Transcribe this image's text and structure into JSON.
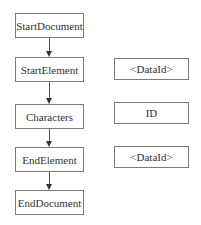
{
  "diagram": {
    "flow": [
      {
        "label": "StartDocument"
      },
      {
        "label": "StartElement"
      },
      {
        "label": "Characters"
      },
      {
        "label": "EndElement"
      },
      {
        "label": "EndDocument"
      }
    ],
    "values": [
      {
        "label": "<DataId>"
      },
      {
        "label": "ID"
      },
      {
        "label": "<DataId>"
      }
    ],
    "colors": {
      "border": "#7a7a7a",
      "arrow": "#333333",
      "background": "#ffffff"
    }
  }
}
